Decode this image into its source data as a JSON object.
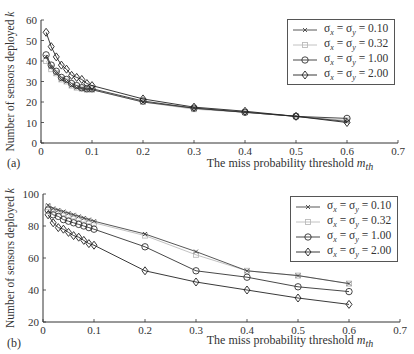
{
  "chart_data": [
    {
      "id": "a",
      "type": "line",
      "panel_label": "(a)",
      "title": "",
      "xlabel": "The miss probability threshold m_th",
      "xlabel_text": "The miss probability threshold ",
      "xlabel_var": "m",
      "xlabel_sub": "th",
      "ylabel": "Number of sensors deployed k",
      "ylabel_text": "Number of sensors deployed ",
      "ylabel_var": "k",
      "xlim": [
        0,
        0.7
      ],
      "ylim": [
        0,
        60
      ],
      "xticks": [
        "0",
        "0.1",
        "0.2",
        "0.3",
        "0.4",
        "0.5",
        "0.6",
        "0.7"
      ],
      "yticks": [
        "0",
        "10",
        "20",
        "30",
        "40",
        "50",
        "60"
      ],
      "grid": false,
      "legend_position": "upper right",
      "x": [
        0.01,
        0.02,
        0.03,
        0.04,
        0.05,
        0.06,
        0.07,
        0.08,
        0.09,
        0.1,
        0.2,
        0.3,
        0.4,
        0.5,
        0.6
      ],
      "series": [
        {
          "name": "σx = σy = 0.10",
          "label_main": "σ",
          "marker": "x",
          "color": "#444444",
          "values": [
            42,
            37,
            34,
            31,
            30,
            28,
            27,
            26.5,
            26,
            26,
            20,
            17,
            15,
            13,
            10.5
          ]
        },
        {
          "name": "σx = σy = 0.32",
          "marker": "square",
          "color": "#bbbbbb",
          "values": [
            40,
            36,
            34,
            31,
            30,
            28,
            27,
            26.5,
            26,
            26,
            20,
            16.5,
            15,
            13,
            11
          ]
        },
        {
          "name": "σx = σy = 1.00",
          "marker": "circle",
          "color": "#333333",
          "values": [
            43,
            38,
            35,
            32,
            31,
            29,
            28,
            27,
            26.5,
            26.5,
            20.5,
            17,
            15,
            13,
            12
          ]
        },
        {
          "name": "σx = σy = 2.00",
          "marker": "diamond",
          "color": "#222222",
          "values": [
            54,
            47,
            42,
            38,
            36,
            33,
            32,
            31,
            29,
            28,
            21.5,
            17.5,
            15.5,
            13,
            10
          ]
        }
      ]
    },
    {
      "id": "b",
      "type": "line",
      "panel_label": "(b)",
      "title": "",
      "xlabel": "The miss probability threshold m_th",
      "xlabel_text": "The miss probability threshold ",
      "xlabel_var": "m",
      "xlabel_sub": "th",
      "ylabel": "Number of sensors deployed k",
      "ylabel_text": "Number of sensors deployed ",
      "ylabel_var": "k",
      "xlim": [
        0,
        0.7
      ],
      "ylim": [
        20,
        100
      ],
      "xticks": [
        "0",
        "0.1",
        "0.2",
        "0.3",
        "0.4",
        "0.5",
        "0.6",
        "0.7"
      ],
      "yticks": [
        "20",
        "40",
        "60",
        "80",
        "100"
      ],
      "grid": false,
      "legend_position": "upper right",
      "x": [
        0.01,
        0.02,
        0.03,
        0.04,
        0.05,
        0.06,
        0.07,
        0.08,
        0.09,
        0.1,
        0.2,
        0.3,
        0.4,
        0.5,
        0.6
      ],
      "series": [
        {
          "name": "σx = σy = 0.10",
          "marker": "x",
          "color": "#444444",
          "values": [
            93,
            91,
            90,
            89,
            88,
            87,
            86,
            85,
            84,
            83,
            75,
            64,
            52,
            49,
            44
          ]
        },
        {
          "name": "σx = σy = 0.32",
          "marker": "square",
          "color": "#bbbbbb",
          "values": [
            92,
            90,
            89,
            88,
            87,
            86,
            85,
            84,
            83,
            82,
            74,
            62,
            52,
            49,
            44
          ]
        },
        {
          "name": "σx = σy = 1.00",
          "marker": "circle",
          "color": "#333333",
          "values": [
            90,
            87,
            86,
            84,
            83,
            82,
            81,
            80,
            79,
            78,
            67,
            52,
            48,
            42,
            39
          ]
        },
        {
          "name": "σx = σy = 2.00",
          "marker": "diamond",
          "color": "#222222",
          "values": [
            87,
            82,
            79,
            78,
            76,
            74,
            73,
            71,
            69,
            68,
            52,
            45,
            40,
            35,
            31
          ]
        }
      ]
    }
  ],
  "legend": {
    "entries": [
      {
        "sym": "σ",
        "sub_x": "x",
        "eq": " = ",
        "sub_y": "y",
        "value": " = 0.10"
      },
      {
        "sym": "σ",
        "sub_x": "x",
        "eq": " = ",
        "sub_y": "y",
        "value": " = 0.32"
      },
      {
        "sym": "σ",
        "sub_x": "x",
        "eq": " = ",
        "sub_y": "y",
        "value": " = 1.00"
      },
      {
        "sym": "σ",
        "sub_x": "x",
        "eq": " = ",
        "sub_y": "y",
        "value": " = 2.00"
      }
    ]
  }
}
